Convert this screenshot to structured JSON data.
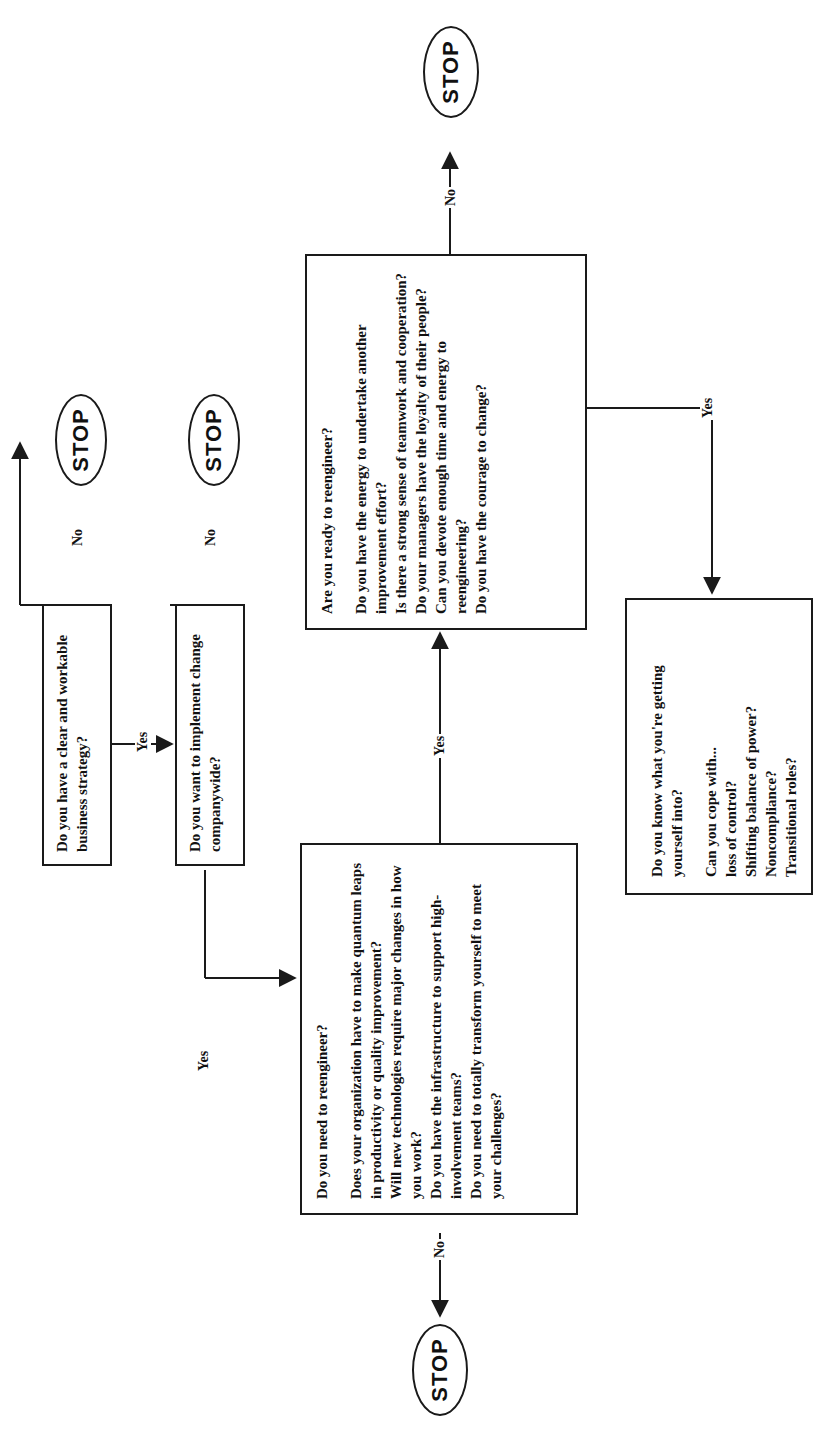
{
  "diagram": {
    "orientation": "rotated-90-ccw",
    "nodes": {
      "strategy": {
        "questions": [
          "Do you have a clear and workable business strategy?"
        ]
      },
      "companywide": {
        "questions": [
          "Do you want to implement change companywide?"
        ]
      },
      "need": {
        "title": "Do you need to reengineer?",
        "questions": [
          "Does your organization have to make quantum leaps in productivity or quality improvement?",
          "Will new technologies require major changes in how you work?",
          "Do you have the infrastructure to support high-involvement teams?",
          "Do you need to totally transform yourself to meet your challenges?"
        ]
      },
      "ready": {
        "title": "Are you ready to reengineer?",
        "questions": [
          "Do you have the energy to undertake another improvement effort?",
          "Is there a strong sense of teamwork and cooperation?",
          "Do your managers have the loyalty of their people?",
          "Can you devote enough time and energy to reengineering?",
          "Do you have the courage to change?"
        ]
      },
      "know": {
        "title": "Do you know what you're getting yourself into?",
        "subtitle": "Can you cope with...",
        "questions": [
          "loss of control?",
          "Shifting balance of power?",
          "Noncompliance?",
          "Transitional roles?"
        ]
      }
    },
    "stops": [
      "STOP",
      "STOP",
      "STOP",
      "STOP"
    ],
    "edges": {
      "yes": "Yes",
      "no": "No"
    },
    "colors": {
      "ink": "#1a1a1a",
      "paper": "#ffffff"
    }
  }
}
